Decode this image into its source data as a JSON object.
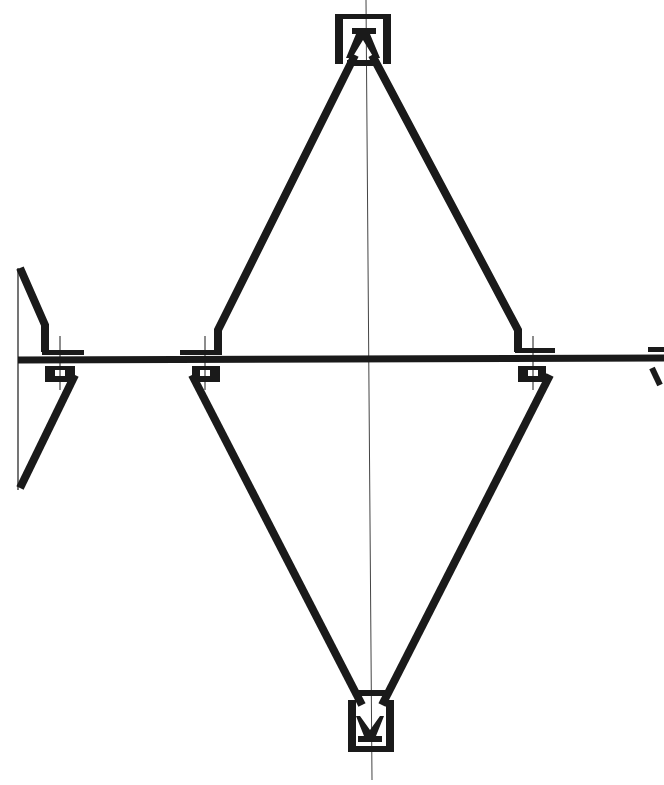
{
  "diagram": {
    "type": "technical-section-drawing",
    "colors": {
      "ink": "#1a1a1a",
      "background": "#ffffff",
      "axis": "#444444"
    },
    "nodes": [
      {
        "id": "top-node",
        "x": 362,
        "y": 42
      },
      {
        "id": "bottom-node",
        "x": 370,
        "y": 720
      },
      {
        "id": "left-upper-joint",
        "x": 218,
        "y": 350
      },
      {
        "id": "left-lower-joint",
        "x": 205,
        "y": 372
      },
      {
        "id": "right-upper-joint",
        "x": 522,
        "y": 350
      },
      {
        "id": "right-lower-joint",
        "x": 540,
        "y": 372
      },
      {
        "id": "far-left-joint",
        "x": 60,
        "y": 360
      },
      {
        "id": "far-right-joint",
        "x": 655,
        "y": 360
      }
    ],
    "axes": {
      "vertical_center_x": 366,
      "horizontal_chord_y": 360
    }
  }
}
